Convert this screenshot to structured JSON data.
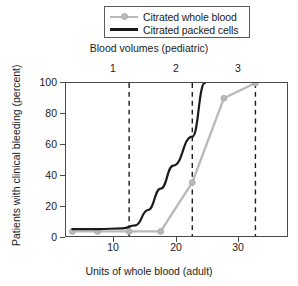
{
  "legend": {
    "items": [
      {
        "label": "Citrated whole blood",
        "color": "#b9b9b9",
        "marker": "circle",
        "key_icon": "gray-line-with-dot-icon"
      },
      {
        "label": "Citrated packed cells",
        "color": "#1a1a1a",
        "marker": "none",
        "key_icon": "black-line-icon"
      }
    ]
  },
  "chart_data": {
    "type": "line",
    "title": "",
    "xlabel": "Units of whole blood (adult)",
    "ylabel": "Patients with clinical bleeding (percent)",
    "top_axis_label": "Blood volumes (pediatric)",
    "xlim": [
      0,
      35
    ],
    "ylim": [
      0,
      100
    ],
    "xticks": [
      10,
      20,
      30
    ],
    "xticklabels": [
      "10",
      "20",
      "30"
    ],
    "yticks": [
      0,
      20,
      40,
      60,
      80,
      100
    ],
    "yticklabels": [
      "0",
      "20",
      "40",
      "60",
      "80",
      "100"
    ],
    "top_ticks": [
      10,
      20,
      30
    ],
    "top_ticklabels": [
      "1",
      "2",
      "3"
    ],
    "grid": false,
    "vertical_dashed_lines": [
      10,
      20,
      30
    ],
    "legend_position": "above-plot-center",
    "series": [
      {
        "name": "Citrated whole blood",
        "color": "#b9b9b9",
        "marker": "circle",
        "x": [
          1,
          5,
          10,
          15,
          20,
          25,
          30
        ],
        "values": [
          3,
          3,
          3,
          3,
          35,
          90,
          100
        ]
      },
      {
        "name": "Citrated packed cells",
        "color": "#1a1a1a",
        "marker": "none",
        "x": [
          1,
          5,
          9,
          11,
          13,
          15,
          17,
          20,
          22
        ],
        "values": [
          4.5,
          4.5,
          5,
          7,
          17,
          31,
          46,
          65,
          100
        ]
      }
    ]
  },
  "colors": {
    "gray_series": "#b9b9b9",
    "black_series": "#1a1a1a",
    "frame": "#4a4a4a",
    "dashed": "#1a1a1a",
    "background": "#ffffff"
  }
}
